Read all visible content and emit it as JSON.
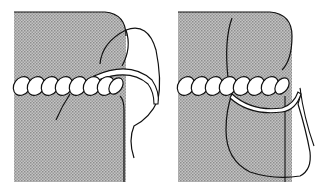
{
  "figure": {
    "panels": [
      {
        "id": "left",
        "description": "needle passing under cord at fabric edge"
      },
      {
        "id": "right",
        "description": "needle passing through fabric below twisted cord"
      }
    ],
    "colors": {
      "fabric": "#b8b8b8",
      "fabric_dot": "#8e8e8e",
      "line": "#111111",
      "background": "#ffffff"
    }
  }
}
